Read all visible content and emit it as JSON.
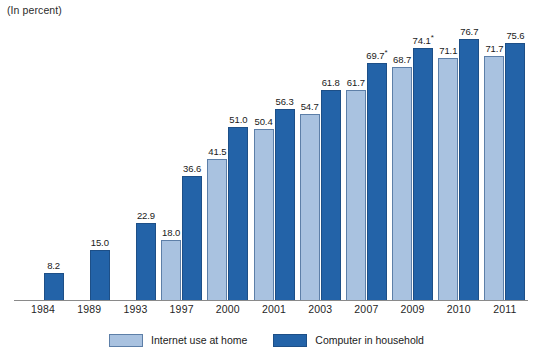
{
  "chart_data": {
    "type": "bar",
    "title": "",
    "subtitle": "",
    "note": "(In percent)",
    "xlabel": "",
    "ylabel": "",
    "ylim": [
      0,
      80
    ],
    "grid": false,
    "legend_position": "bottom-center",
    "categories": [
      "1984",
      "1989",
      "1993",
      "1997",
      "2000",
      "2001",
      "2003",
      "2007",
      "2009",
      "2010",
      "2011"
    ],
    "series": [
      {
        "name": "Internet use at home",
        "color": "#a9c2e0",
        "values": [
          null,
          null,
          null,
          18.0,
          41.5,
          50.4,
          54.7,
          61.7,
          68.7,
          71.1,
          71.7
        ],
        "labels": [
          "",
          "",
          "",
          "18.0",
          "41.5",
          "50.4",
          "54.7",
          "61.7",
          "68.7",
          "71.1",
          "71.7"
        ]
      },
      {
        "name": "Computer in household",
        "color": "#2363a8",
        "values": [
          8.2,
          15.0,
          22.9,
          36.6,
          51.0,
          56.3,
          61.8,
          69.7,
          74.1,
          76.7,
          75.6
        ],
        "labels": [
          "8.2",
          "15.0",
          "22.9",
          "36.6",
          "51.0",
          "56.3",
          "61.8",
          "69.7",
          "74.1",
          "76.7",
          "75.6"
        ],
        "footnote_markers": [
          false,
          false,
          false,
          false,
          false,
          false,
          false,
          true,
          true,
          false,
          false
        ]
      }
    ],
    "footnote_symbol": "*"
  },
  "legend": {
    "items": [
      {
        "label": "Internet use at home",
        "color": "#a9c2e0"
      },
      {
        "label": "Computer in household",
        "color": "#2363a8"
      }
    ]
  }
}
